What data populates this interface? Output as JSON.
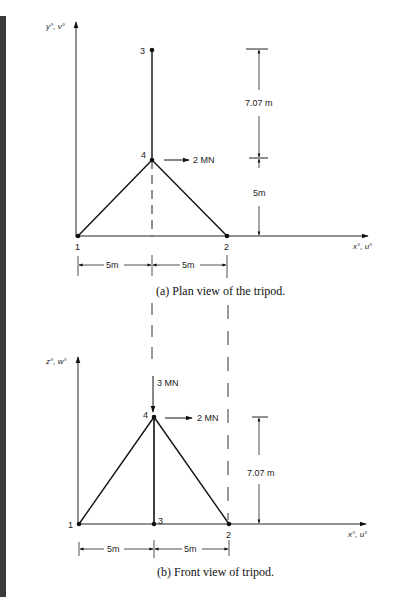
{
  "figure": {
    "plan_view": {
      "axis_y_label": "y°, v°",
      "axis_x_label": "x°, u°",
      "nodes": [
        {
          "id": "1",
          "label": "1"
        },
        {
          "id": "2",
          "label": "2"
        },
        {
          "id": "3",
          "label": "3"
        },
        {
          "id": "4",
          "label": "4"
        }
      ],
      "load_label": "2 MN",
      "dim_upper": "7.07 m",
      "dim_lower": "5m",
      "dim_left": "5m",
      "dim_right": "5m",
      "caption": "(a)  Plan view of the tripod."
    },
    "front_view": {
      "axis_z_label": "z°, w°",
      "axis_x_label": "x°, u°",
      "nodes": [
        {
          "id": "1",
          "label": "1"
        },
        {
          "id": "2",
          "label": "2"
        },
        {
          "id": "3",
          "label": "3"
        },
        {
          "id": "4",
          "label": "4"
        }
      ],
      "vertical_load_label": "3 MN",
      "horizontal_load_label": "2 MN",
      "dim_height": "7.07 m",
      "dim_left": "5m",
      "dim_right": "5m",
      "caption": "(b)  Front view of tripod."
    }
  }
}
